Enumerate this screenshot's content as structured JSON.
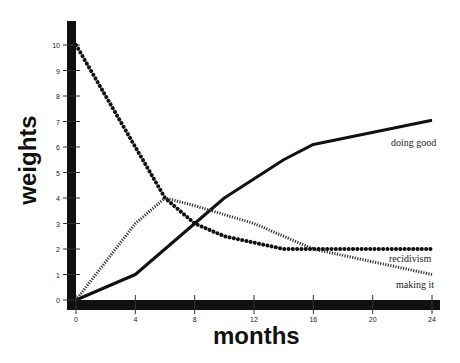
{
  "chart_data": {
    "type": "line",
    "title": "",
    "xlabel": "months",
    "ylabel": "weights",
    "xlim": [
      0,
      24
    ],
    "ylim": [
      0,
      10
    ],
    "x_ticks": [
      0,
      4,
      8,
      12,
      16,
      20,
      24
    ],
    "y_ticks": [
      0,
      1,
      2,
      3,
      4,
      5,
      6,
      7,
      8,
      9,
      10
    ],
    "grid": false,
    "legend": "inline labels at right end of lines",
    "series": [
      {
        "name": "doing good",
        "style": "solid",
        "x": [
          0,
          4,
          10,
          14,
          16,
          24
        ],
        "values": [
          0,
          1,
          4,
          5.5,
          6.1,
          7.05
        ]
      },
      {
        "name": "recidivism",
        "style": "hatched",
        "x": [
          0,
          4,
          6,
          8,
          12,
          16,
          24
        ],
        "values": [
          0,
          3,
          4,
          3.7,
          3,
          2,
          1
        ]
      },
      {
        "name": "making it",
        "style": "dotted",
        "x": [
          0,
          4,
          6,
          8,
          10,
          14,
          24
        ],
        "values": [
          10,
          6,
          4,
          3,
          2.5,
          2,
          2
        ]
      }
    ]
  },
  "labels": {
    "ylabel": "weights",
    "xlabel": "months",
    "doing_good": "doing good",
    "recidivism": "recidivism",
    "making_it": "making it"
  }
}
